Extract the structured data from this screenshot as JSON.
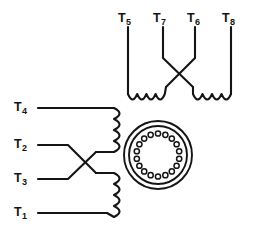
{
  "figure": {
    "type": "electrical-schematic",
    "background_color": "#ffffff",
    "line_color": "#141414",
    "width": 254,
    "height": 231
  },
  "top_group": {
    "name": "upper-winding-group",
    "terminals": [
      {
        "id": "T5",
        "base": "T",
        "sub": "5",
        "label": "T5",
        "label_x": 118,
        "label_y": 12,
        "lead_x": 128
      },
      {
        "id": "T7",
        "base": "T",
        "sub": "7",
        "label": "T7",
        "label_x": 153,
        "label_y": 12,
        "lead_x": 163
      },
      {
        "id": "T6",
        "base": "T",
        "sub": "6",
        "label": "T6",
        "label_x": 187,
        "label_y": 12,
        "lead_x": 195
      },
      {
        "id": "T8",
        "base": "T",
        "sub": "8",
        "label": "T8",
        "label_x": 222,
        "label_y": 12,
        "lead_x": 231
      }
    ],
    "crossover": {
      "present": true,
      "between": [
        "T7",
        "T6"
      ],
      "style": "X-cross"
    },
    "coils": [
      {
        "name": "upper-left-coil",
        "arcs": 4,
        "orientation": "horizontal"
      },
      {
        "name": "upper-right-coil",
        "arcs": 4,
        "orientation": "horizontal"
      }
    ]
  },
  "left_group": {
    "name": "lower-winding-group",
    "terminals": [
      {
        "id": "T4",
        "base": "T",
        "sub": "4",
        "label": "T4",
        "label_x": 14,
        "label_y": 101,
        "lead_y": 108
      },
      {
        "id": "T2",
        "base": "T",
        "sub": "2",
        "label": "T2",
        "label_x": 14,
        "label_y": 138,
        "lead_y": 145
      },
      {
        "id": "T3",
        "base": "T",
        "sub": "3",
        "label": "T3",
        "label_x": 14,
        "label_y": 172,
        "lead_y": 179
      },
      {
        "id": "T1",
        "base": "T",
        "sub": "1",
        "label": "T1",
        "label_x": 14,
        "label_y": 206,
        "lead_y": 213
      }
    ],
    "crossover": {
      "present": true,
      "between": [
        "T2",
        "T3"
      ],
      "style": "X-cross"
    },
    "coils": [
      {
        "name": "left-upper-coil",
        "arcs": 4,
        "orientation": "vertical"
      },
      {
        "name": "left-lower-coil",
        "arcs": 4,
        "orientation": "vertical"
      }
    ]
  },
  "connector": {
    "name": "circular-multipin-connector",
    "shape": "circle",
    "center_x": 158,
    "center_y": 155,
    "outer_radius": 34,
    "inner_radius": 29,
    "pin_count": 18,
    "pin_radius": 2.6,
    "pin_ring_radius": 21.5
  }
}
